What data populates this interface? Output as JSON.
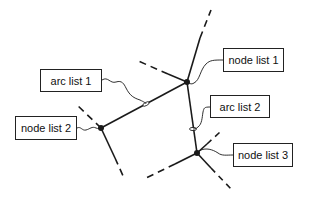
{
  "diagram": {
    "labels": {
      "arc_list_1": "arc list 1",
      "arc_list_2": "arc list 2",
      "node_list_1": "node list 1",
      "node_list_2": "node list 2",
      "node_list_3": "node list 3"
    },
    "colors": {
      "stroke": "#1a1a1a",
      "background": "#ffffff"
    }
  }
}
